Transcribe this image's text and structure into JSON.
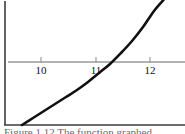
{
  "figure": {
    "name": "graph-figure",
    "background_color": "#ffffff",
    "frame": {
      "border_color": "#3c3c3c",
      "left_x": 5,
      "bottom_y": 125,
      "top_y": 2,
      "right_x": 184
    },
    "caption": "Figure 1.12    The function graphed"
  },
  "chart_data": {
    "type": "line",
    "title": "",
    "subtitle": "",
    "xlabel": "",
    "ylabel": "",
    "grid": false,
    "legend": null,
    "axis": {
      "color": "#9a9a9a",
      "y_pixel": 62,
      "tick_color": "#9a9a9a",
      "tick_labels": [
        "10",
        "11",
        "12"
      ],
      "tick_values": [
        10,
        11,
        12
      ],
      "tick_pixels_x": [
        41,
        96,
        150
      ],
      "tick_label_y_pixel": 66
    },
    "curve": {
      "name": "exponential-curve",
      "color": "#111111",
      "stroke_width": 2.6,
      "x": [
        9.7,
        9.9,
        10.1,
        10.3,
        10.5,
        10.7,
        10.9,
        11.1,
        11.3,
        11.5,
        11.7,
        11.9,
        12.1,
        12.3,
        12.4
      ],
      "y": [
        -0.98,
        -0.86,
        -0.74,
        -0.63,
        -0.52,
        -0.41,
        -0.29,
        -0.16,
        -0.02,
        0.14,
        0.33,
        0.56,
        0.84,
        1.18,
        1.38
      ],
      "points_px": [
        [
          22,
          125
        ],
        [
          33,
          118
        ],
        [
          44,
          111
        ],
        [
          55,
          104
        ],
        [
          66,
          97
        ],
        [
          77,
          90
        ],
        [
          88,
          82
        ],
        [
          99,
          73
        ],
        [
          110,
          64
        ],
        [
          121,
          53
        ],
        [
          132,
          41
        ],
        [
          143,
          27
        ],
        [
          154,
          11
        ],
        [
          165,
          -2
        ],
        [
          172,
          -12
        ]
      ],
      "xlim": [
        9.6,
        12.45
      ],
      "ylim": [
        -1.05,
        1.45
      ]
    }
  }
}
